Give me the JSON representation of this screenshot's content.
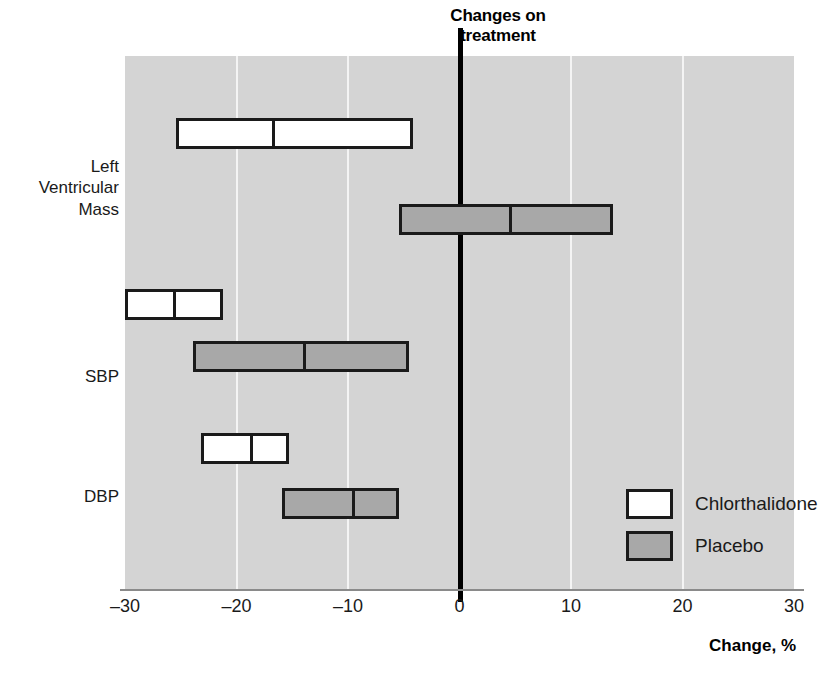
{
  "chart_data": {
    "type": "bar",
    "title": "Changes on\ntreatment",
    "xlabel": "Change, %",
    "ylabel": "",
    "xlim": [
      -30,
      30
    ],
    "xticks": [
      -30,
      -20,
      -10,
      0,
      10,
      20,
      30
    ],
    "xticklabels": [
      "–30",
      "–20",
      "–10",
      "0",
      "10",
      "20",
      "30"
    ],
    "grid": "vertical",
    "reference_line": 0,
    "legend_position": "center-right",
    "categories": [
      "Left\nVentricular\nMass",
      "SBP",
      "DBP"
    ],
    "series": [
      {
        "name": "Chlorthalidone",
        "color": "#ffffff",
        "values": [
          -17.0,
          -25.9,
          -19.0
        ],
        "ranges": [
          [
            -25.4,
            -4.2
          ],
          [
            -31.3,
            -21.2
          ],
          [
            -23.2,
            -15.3
          ]
        ]
      },
      {
        "name": "Placebo",
        "color": "#a8a8a8",
        "values": [
          4.3,
          -14.2,
          -9.8
        ],
        "ranges": [
          [
            -5.4,
            13.8
          ],
          [
            -23.9,
            -4.5
          ],
          [
            -15.9,
            -5.4
          ]
        ]
      }
    ],
    "bars": [
      {
        "category": "Left\nVentricular\nMass",
        "series": "Chlorthalidone",
        "low": -25.4,
        "median": -17.0,
        "high": -4.2,
        "row": 0
      },
      {
        "category": "Left\nVentricular\nMass",
        "series": "Placebo",
        "low": -5.4,
        "median": 4.3,
        "high": 13.8,
        "row": 1
      },
      {
        "category": "SBP",
        "series": "Chlorthalidone",
        "low": -31.3,
        "median": -25.9,
        "high": -21.2,
        "row": 2
      },
      {
        "category": "SBP",
        "series": "Placebo",
        "low": -23.9,
        "median": -14.2,
        "high": -4.5,
        "row": 3
      },
      {
        "category": "DBP",
        "series": "Chlorthalidone",
        "low": -23.2,
        "median": -19.0,
        "high": -15.3,
        "row": 4
      },
      {
        "category": "DBP",
        "series": "Placebo",
        "low": -15.9,
        "median": -9.8,
        "high": -5.4,
        "row": 5
      }
    ]
  },
  "legend": {
    "items": [
      {
        "label": "Chlorthalidone",
        "swatch": "chlorthalidone"
      },
      {
        "label": "Placebo",
        "swatch": "placebo"
      }
    ]
  },
  "axis": {
    "title": "Change, %"
  },
  "colors": {
    "plot_background": "#d4d4d4",
    "gridline": "#f4f4f4",
    "bar_outline": "#1a1a1a",
    "placebo_fill": "#a8a8a8",
    "chlorthalidone_fill": "#ffffff",
    "zero_line": "#000000"
  }
}
